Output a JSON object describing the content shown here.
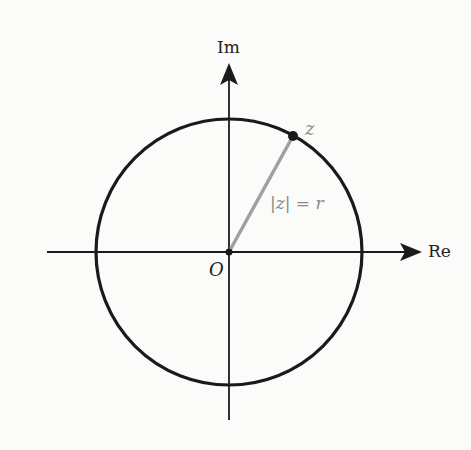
{
  "diagram": {
    "title": "",
    "type": "complex-plane-circle",
    "axes": {
      "real_label": "Re",
      "imag_label": "Im",
      "origin_label": "O"
    },
    "point": {
      "label": "z"
    },
    "radius_label": "|z| = r",
    "geometry": {
      "center": [
        229,
        252
      ],
      "radius": 133,
      "point_z": [
        293,
        136
      ]
    },
    "colors": {
      "circle": "#1a1a1a",
      "axes": "#1a1a1a",
      "radius_segment": "#a0a0a0",
      "point_label": "#8a8a8a",
      "radius_label": "#8a8a8a",
      "background": "#fbfbf9"
    }
  }
}
